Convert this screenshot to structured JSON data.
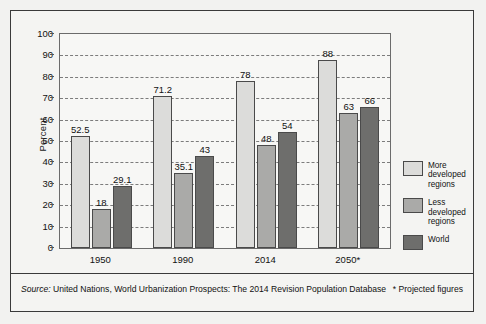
{
  "chart_data": {
    "type": "bar",
    "title": "",
    "xlabel": "",
    "ylabel": "Percent",
    "ylim": [
      0,
      100
    ],
    "ytick_step": 10,
    "yticks": [
      100,
      90,
      80,
      70,
      60,
      50,
      40,
      30,
      20,
      10,
      0
    ],
    "grid": true,
    "legend_position": "right",
    "categories": [
      "1950",
      "1990",
      "2014",
      "2050*"
    ],
    "series": [
      {
        "name": "More developed regions",
        "color": "#dcdcda",
        "values": [
          52.5,
          71.2,
          78,
          88
        ],
        "labels": [
          "52.5",
          "71.2",
          "78",
          "88"
        ]
      },
      {
        "name": "Less developed regions",
        "color": "#aaaaa8",
        "values": [
          18,
          35.1,
          48,
          63
        ],
        "labels": [
          "18",
          "35.1",
          "48",
          "63"
        ]
      },
      {
        "name": "World",
        "color": "#6e6e6c",
        "values": [
          29.1,
          43,
          54,
          66
        ],
        "labels": [
          "29.1",
          "43",
          "54",
          "66"
        ]
      }
    ]
  },
  "legend": {
    "items": [
      {
        "label": "More developed regions",
        "color": "#dcdcda"
      },
      {
        "label": "Less developed regions",
        "color": "#aaaaa8"
      },
      {
        "label": "World",
        "color": "#6e6e6c"
      }
    ]
  },
  "footer": {
    "source_prefix": "Source:",
    "source_text": "United Nations, World Urbanization Prospects: The 2014 Revision Population Database",
    "note": "* Projected figures"
  }
}
